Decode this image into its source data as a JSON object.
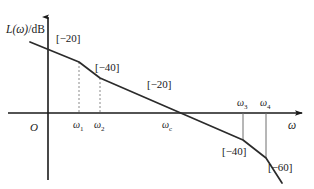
{
  "figure": {
    "type": "bode-magnitude-asymptote-plot",
    "y_axis_label": "L(ω)/dB",
    "x_axis_label": "ω",
    "origin_label": "O"
  },
  "chart_data": {
    "type": "line",
    "title": "",
    "xlabel": "ω",
    "ylabel": "L(ω)/dB",
    "grid": false,
    "legend": null,
    "x_ticks": [
      "ω₁",
      "ω₂",
      "ωₑ",
      "ω₃",
      "ω₄"
    ],
    "x_tick_labels": [
      {
        "text": "ω",
        "sub": "1",
        "x_px": 79
      },
      {
        "text": "ω",
        "sub": "2",
        "x_px": 100
      },
      {
        "text": "ω",
        "sub": "c",
        "x_px": 168
      },
      {
        "text": "ω",
        "sub": "3",
        "x_px": 243
      },
      {
        "text": "ω",
        "sub": "4",
        "x_px": 266
      }
    ],
    "segments": [
      {
        "slope_label": "[−20]",
        "slope_db_per_decade": -20,
        "from": "start",
        "to": "ω₁"
      },
      {
        "slope_label": "[−40]",
        "slope_db_per_decade": -40,
        "from": "ω₁",
        "to": "ω₂"
      },
      {
        "slope_label": "[−20]",
        "slope_db_per_decade": -20,
        "from": "ω₂",
        "to": "ω₃"
      },
      {
        "slope_label": "[−40]",
        "slope_db_per_decade": -40,
        "from": "ω₃",
        "to": "ω₄"
      },
      {
        "slope_label": "[−60]",
        "slope_db_per_decade": -60,
        "from": "ω₄",
        "to": "end"
      }
    ],
    "breakpoints_px": [
      {
        "x": 30,
        "y": 42
      },
      {
        "x": 79,
        "y": 62
      },
      {
        "x": 100,
        "y": 78
      },
      {
        "x": 243,
        "y": 140
      },
      {
        "x": 266,
        "y": 158
      },
      {
        "x": 282,
        "y": 183
      }
    ],
    "crossover_px": {
      "x": 185,
      "y": 113
    },
    "axes_px": {
      "y_axis_x": 48,
      "x_axis_y": 113
    }
  },
  "slope_labels": [
    {
      "id": "slope-1",
      "text": "[−20]",
      "x": 56,
      "y": 33
    },
    {
      "id": "slope-2",
      "text": "[−40]",
      "x": 95,
      "y": 62
    },
    {
      "id": "slope-3",
      "text": "[−20]",
      "x": 147,
      "y": 79
    },
    {
      "id": "slope-4",
      "text": "[−40]",
      "x": 222,
      "y": 146
    },
    {
      "id": "slope-5",
      "text": "[−60]",
      "x": 268,
      "y": 162
    }
  ],
  "colors": {
    "ink": "#1a1a1a",
    "curve": "#2b2b2b",
    "dashed": "#8a8a8a",
    "background": "#ffffff"
  }
}
